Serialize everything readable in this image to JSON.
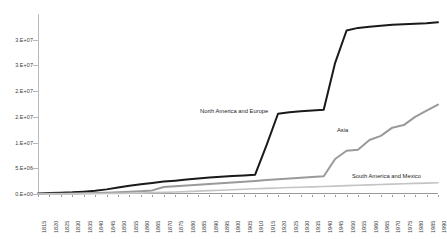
{
  "chart_data": {
    "type": "line",
    "title": "",
    "subtitle": "",
    "xlabel": "",
    "ylabel": "",
    "grid": false,
    "legend_position": "inline-series-labels",
    "xlim": [
      1815,
      1990
    ],
    "ylim": [
      0,
      35000000
    ],
    "y_tick_values": [
      0,
      5000000,
      10000000,
      15000000,
      20000000,
      25000000,
      30000000
    ],
    "y_tick_labels": [
      "0.E+00",
      "5.E+06",
      "1.E+07",
      "2.E+07",
      "2.E+07",
      "3.E+07",
      "3.E+07"
    ],
    "x": [
      1815,
      1820,
      1825,
      1830,
      1835,
      1840,
      1845,
      1850,
      1855,
      1860,
      1865,
      1870,
      1875,
      1880,
      1885,
      1890,
      1895,
      1900,
      1905,
      1910,
      1915,
      1920,
      1925,
      1930,
      1935,
      1940,
      1945,
      1950,
      1955,
      1960,
      1965,
      1970,
      1975,
      1980,
      1985,
      1990
    ],
    "x_tick_labels": [
      "1815",
      "1820",
      "1825",
      "1830",
      "1835",
      "1840",
      "1845",
      "1850",
      "1855",
      "1860",
      "1865",
      "1870",
      "1875",
      "1880",
      "1885",
      "1890",
      "1895",
      "1900",
      "1905",
      "1910",
      "1915",
      "1920",
      "1925",
      "1930",
      "1935",
      "1940",
      "1945",
      "1950",
      "1955",
      "1960",
      "1965",
      "1970",
      "1975",
      "1980",
      "1985",
      "1990"
    ],
    "series": [
      {
        "name": "North America and Europe",
        "color": "#1a1a1a",
        "width": 2.0,
        "values": [
          120000,
          180000,
          250000,
          330000,
          460000,
          640000,
          900000,
          1250000,
          1600000,
          1900000,
          2150000,
          2420000,
          2600000,
          2800000,
          3000000,
          3200000,
          3350000,
          3500000,
          3620000,
          3750000,
          9500000,
          15600000,
          15900000,
          16100000,
          16250000,
          16400000,
          25500000,
          31800000,
          32300000,
          32500000,
          32700000,
          32900000,
          33000000,
          33100000,
          33200000,
          33400000
        ]
      },
      {
        "name": "Asia",
        "color": "#9a9a9a",
        "width": 2.0,
        "values": [
          30000,
          50000,
          70000,
          95000,
          130000,
          180000,
          240000,
          320000,
          420000,
          540000,
          700000,
          1350000,
          1500000,
          1650000,
          1800000,
          1950000,
          2100000,
          2250000,
          2400000,
          2550000,
          2700000,
          2850000,
          3000000,
          3150000,
          3300000,
          3450000,
          6800000,
          8400000,
          8600000,
          10500000,
          11300000,
          12900000,
          13400000,
          15000000,
          16200000,
          17400000
        ]
      },
      {
        "name": "South America and Mexico",
        "color": "#c4c4c4",
        "width": 1.6,
        "values": [
          10000,
          16000,
          24000,
          34000,
          48000,
          66000,
          90000,
          120000,
          160000,
          205000,
          260000,
          320000,
          390000,
          470000,
          560000,
          650000,
          740000,
          830000,
          920000,
          1010000,
          1100000,
          1180000,
          1250000,
          1320000,
          1390000,
          1460000,
          1540000,
          1620000,
          1700000,
          1780000,
          1850000,
          1920000,
          1990000,
          2060000,
          2120000,
          2180000
        ]
      }
    ]
  }
}
